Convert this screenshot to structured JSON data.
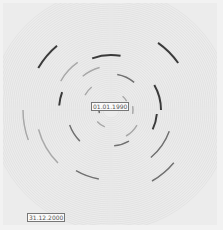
{
  "chart_data": {
    "type": "radial-timeline",
    "title": "",
    "center": {
      "x": 111,
      "y": 110
    },
    "start_label": "01.01.1990",
    "end_label": "31.12.2000",
    "rings": {
      "count": 11,
      "inner_radius": 8,
      "outer_radius": 100
    },
    "colors": {
      "background": "#ececec",
      "ring": "#dcdcdc",
      "segment_dark": "#3a3a3a",
      "segment_mid": "#707070",
      "segment_light": "#a8a8a8"
    },
    "segments": [
      {
        "r": 12,
        "start": 255,
        "end": 280,
        "tone": "mid"
      },
      {
        "r": 18,
        "start": 40,
        "end": 60,
        "tone": "light"
      },
      {
        "r": 18,
        "start": 200,
        "end": 230,
        "tone": "light"
      },
      {
        "r": 22,
        "start": 80,
        "end": 100,
        "tone": "light"
      },
      {
        "r": 30,
        "start": 300,
        "end": 320,
        "tone": "light"
      },
      {
        "r": 30,
        "start": 120,
        "end": 150,
        "tone": "light"
      },
      {
        "r": 36,
        "start": 10,
        "end": 40,
        "tone": "mid"
      },
      {
        "r": 36,
        "start": 150,
        "end": 175,
        "tone": "mid"
      },
      {
        "r": 44,
        "start": 225,
        "end": 250,
        "tone": "mid"
      },
      {
        "r": 44,
        "start": 320,
        "end": 345,
        "tone": "light"
      },
      {
        "r": 46,
        "start": 95,
        "end": 115,
        "tone": "dark"
      },
      {
        "r": 50,
        "start": 60,
        "end": 90,
        "tone": "dark"
      },
      {
        "r": 52,
        "start": 275,
        "end": 290,
        "tone": "dark"
      },
      {
        "r": 55,
        "start": 340,
        "end": 10,
        "tone": "dark"
      },
      {
        "r": 58,
        "start": 300,
        "end": 325,
        "tone": "light"
      },
      {
        "r": 62,
        "start": 110,
        "end": 140,
        "tone": "mid"
      },
      {
        "r": 70,
        "start": 190,
        "end": 210,
        "tone": "mid"
      },
      {
        "r": 75,
        "start": 225,
        "end": 255,
        "tone": "light"
      },
      {
        "r": 82,
        "start": 35,
        "end": 55,
        "tone": "dark"
      },
      {
        "r": 82,
        "start": 130,
        "end": 150,
        "tone": "mid"
      },
      {
        "r": 84,
        "start": 300,
        "end": 320,
        "tone": "dark"
      },
      {
        "r": 88,
        "start": 250,
        "end": 270,
        "tone": "light"
      }
    ]
  },
  "labels": {
    "start": "01.01.1990",
    "end": "31.12.2000"
  }
}
